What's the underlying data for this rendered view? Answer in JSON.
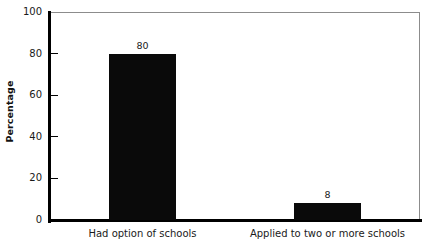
{
  "chart_data": {
    "type": "bar",
    "title": "",
    "xlabel": "",
    "ylabel": "Percentage",
    "categories": [
      "Had option of schools",
      "Applied to two or more schools"
    ],
    "values": [
      80,
      8
    ],
    "value_labels": [
      "80",
      "8"
    ],
    "ylim": [
      0,
      100
    ],
    "yticks": [
      0,
      20,
      40,
      60,
      80,
      100
    ],
    "ytick_labels": [
      "0",
      "20",
      "40",
      "60",
      "80",
      "100"
    ],
    "grid": false,
    "legend": null,
    "bar_color": "#0a0a0a",
    "axis_color": "#000000",
    "frame_color": "#8c8c8c",
    "background": "#ffffff"
  }
}
